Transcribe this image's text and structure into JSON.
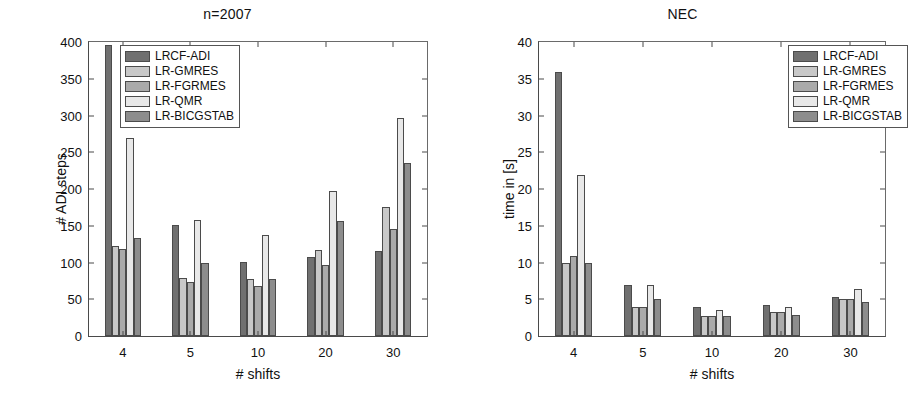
{
  "figure": {
    "series_colors": [
      "#707070",
      "#c8c8c8",
      "#aaaaaa",
      "#e8e8e8",
      "#8d8d8d"
    ],
    "series_names": [
      "LRCF-ADI",
      "LR-GMRES",
      "LR-FGRMES",
      "LR-QMR",
      "LR-BICGSTAB"
    ]
  },
  "chart_data": [
    {
      "type": "bar",
      "title": "n=2007",
      "xlabel": "# shifts",
      "ylabel": "# ADI steps",
      "categories": [
        "4",
        "5",
        "10",
        "20",
        "30"
      ],
      "ylim": [
        0,
        400
      ],
      "yticks": [
        0,
        50,
        100,
        150,
        200,
        250,
        300,
        350,
        400
      ],
      "grid": false,
      "legend_position": "top-center",
      "series": [
        {
          "name": "LRCF-ADI",
          "values": [
            396,
            151,
            101,
            108,
            116
          ]
        },
        {
          "name": "LR-GMRES",
          "values": [
            123,
            79,
            78,
            117,
            176
          ]
        },
        {
          "name": "LR-FGRMES",
          "values": [
            119,
            74,
            68,
            97,
            146
          ]
        },
        {
          "name": "LR-QMR",
          "values": [
            270,
            158,
            137,
            197,
            296
          ]
        },
        {
          "name": "LR-BICGSTAB",
          "values": [
            134,
            99,
            78,
            157,
            236
          ]
        }
      ]
    },
    {
      "type": "bar",
      "title": "NEC",
      "xlabel": "# shifts",
      "ylabel": "time in [s]",
      "categories": [
        "4",
        "5",
        "10",
        "20",
        "30"
      ],
      "ylim": [
        0,
        40
      ],
      "yticks": [
        0,
        5,
        10,
        15,
        20,
        25,
        30,
        35,
        40
      ],
      "grid": false,
      "legend_position": "top-right",
      "series": [
        {
          "name": "LRCF-ADI",
          "values": [
            35.9,
            6.9,
            4.0,
            4.2,
            5.3
          ]
        },
        {
          "name": "LR-GMRES",
          "values": [
            9.9,
            3.9,
            2.7,
            3.2,
            5.1
          ]
        },
        {
          "name": "LR-FGRMES",
          "values": [
            10.9,
            3.9,
            2.7,
            3.2,
            5.0
          ]
        },
        {
          "name": "LR-QMR",
          "values": [
            21.9,
            6.9,
            3.5,
            3.9,
            6.4
          ]
        },
        {
          "name": "LR-BICGSTAB",
          "values": [
            9.9,
            5.0,
            2.7,
            2.9,
            4.6
          ]
        }
      ]
    }
  ]
}
